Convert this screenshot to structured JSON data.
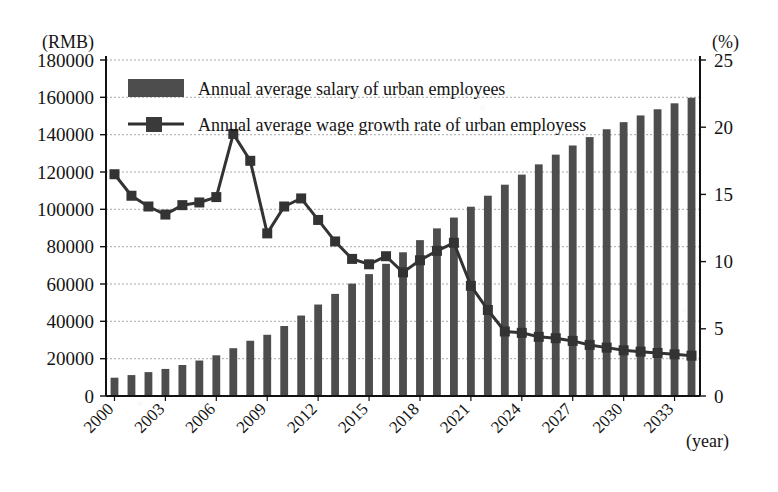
{
  "chart_data": {
    "type": "bar",
    "title": "",
    "subtitle": "",
    "xlabel": "(year)",
    "ylabel": "(RMB)",
    "y2label": "(%)",
    "ylim": [
      0,
      180000
    ],
    "y2lim": [
      0,
      25
    ],
    "ytick_step": 20000,
    "y2tick_step": 5,
    "grid": true,
    "legend_position": "top-left",
    "categories": [
      "2000",
      "2001",
      "2002",
      "2003",
      "2004",
      "2005",
      "2006",
      "2007",
      "2008",
      "2009",
      "2010",
      "2011",
      "2012",
      "2013",
      "2014",
      "2015",
      "2016",
      "2017",
      "2018",
      "2019",
      "2020",
      "2021",
      "2022",
      "2023",
      "2024",
      "2025",
      "2026",
      "2027",
      "2028",
      "2029",
      "2030",
      "2031",
      "2032",
      "2033",
      "2034"
    ],
    "xtick_labels": [
      "2000",
      "2003",
      "2006",
      "2009",
      "2012",
      "2015",
      "2018",
      "2021",
      "2024",
      "2027",
      "2030",
      "2033"
    ],
    "yticks": [
      "0",
      "20000",
      "40000",
      "60000",
      "80000",
      "100000",
      "120000",
      "140000",
      "160000",
      "180000"
    ],
    "y2ticks": [
      "0",
      "5",
      "10",
      "15",
      "20",
      "25"
    ],
    "series": [
      {
        "name": "Annual average salary of urban employees",
        "type": "bar",
        "axis": "left",
        "color": "#4d4d4d",
        "values": [
          9800,
          11200,
          12800,
          14500,
          16600,
          19000,
          21800,
          25600,
          29600,
          32800,
          37500,
          43100,
          49000,
          54700,
          60200,
          65300,
          70800,
          77000,
          83500,
          89800,
          95600,
          101400,
          107300,
          113200,
          118600,
          124100,
          129300,
          134200,
          138700,
          142900,
          146700,
          150300,
          153600,
          156800,
          159800
        ]
      },
      {
        "name": "Annual  average wage growth rate of urban employess",
        "type": "line",
        "axis": "right",
        "color": "#333333",
        "marker": "square",
        "values": [
          16.5,
          14.9,
          14.1,
          13.5,
          14.2,
          14.4,
          14.8,
          19.5,
          17.5,
          12.1,
          14.1,
          14.7,
          13.1,
          11.5,
          10.2,
          9.8,
          10.4,
          9.2,
          10.1,
          10.8,
          11.4,
          8.2,
          6.4,
          4.8,
          4.7,
          4.4,
          4.3,
          4.1,
          3.8,
          3.6,
          3.4,
          3.3,
          3.2,
          3.1,
          3.0
        ]
      }
    ]
  },
  "legend": {
    "entries": [
      {
        "key": "bar-swatch",
        "label": "Annual average salary of urban employees"
      },
      {
        "key": "line-swatch",
        "label": "Annual  average wage growth rate of urban employess"
      }
    ]
  },
  "axes": {
    "left_unit": "(RMB)",
    "right_unit": "(%)",
    "x_unit": "(year)"
  },
  "colors": {
    "bar": "#4d4d4d",
    "line": "#2e2e2e",
    "grid": "#9a9a9a",
    "axis": "#111111",
    "background": "#ffffff"
  }
}
